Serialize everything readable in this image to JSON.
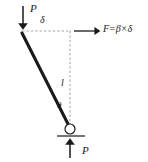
{
  "figure": {
    "type": "mechanics-free-body-diagram",
    "background_color": "#ffffff",
    "stroke_color": "#1a1a1a",
    "dashed_color": "#9a9a9a",
    "width": 148,
    "height": 162
  },
  "labels": {
    "load_top": "P",
    "reaction_bottom": "P",
    "deflection": "δ",
    "length": "l",
    "angle": "θ",
    "force_symbol": "F",
    "equals": "=",
    "stiffness": "β",
    "times": "×",
    "force_equation": "F = β × δ"
  },
  "geometry": {
    "rod_top_x": 22,
    "rod_top_y": 33,
    "pivot_x": 70,
    "pivot_y": 129,
    "pivot_radius": 5,
    "ground_line_y": 136,
    "ground_line_x1": 57,
    "ground_line_x2": 85,
    "vertical_dashed_x": 70,
    "vertical_dashed_y1": 31,
    "vertical_dashed_y2": 126,
    "horizontal_dashed_y": 31,
    "horizontal_dashed_x1": 22,
    "horizontal_dashed_x2": 70,
    "force_arrow_x1": 74,
    "force_arrow_x2": 99,
    "force_arrow_y": 31,
    "load_arrow_x": 23,
    "load_arrow_y1": 7,
    "load_arrow_y2": 28,
    "reaction_arrow_x": 70,
    "reaction_arrow_y1": 158,
    "reaction_arrow_y2": 140
  }
}
